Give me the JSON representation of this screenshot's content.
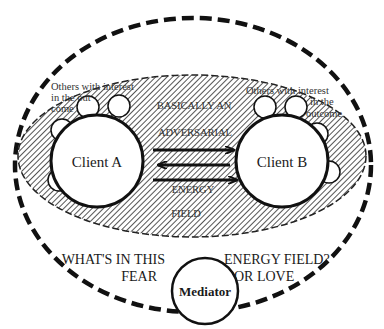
{
  "diagram": {
    "outer_field": {
      "shape": "dashed-ellipse",
      "stroke": "#111111"
    },
    "adversarial_field": {
      "shape": "hatched-ellipse",
      "fill_hatch": "#222222"
    },
    "client_a": {
      "label": "Client A"
    },
    "client_b": {
      "label": "Client B"
    },
    "mediator": {
      "label": "Mediator"
    },
    "others_left": {
      "lines": [
        "Others  with interest",
        "in the out",
        "come"
      ]
    },
    "others_right": {
      "lines": [
        "Others  with  interest",
        "in the",
        "outcome"
      ]
    },
    "center_text": {
      "line1": "BASICALLY AN",
      "line2": "ADVERSARIAL",
      "line3": "ENERGY",
      "line4": "FIELD"
    },
    "question_left": {
      "line1": "WHAT'S IN THIS",
      "line2": "FEAR"
    },
    "question_right": {
      "line1": "ENERGY FIELD?",
      "line2": "OR LOVE"
    },
    "arrows": [
      {
        "direction": "right"
      },
      {
        "direction": "left"
      },
      {
        "direction": "right"
      }
    ],
    "satellite_count_left": 4,
    "satellite_count_right": 4
  }
}
